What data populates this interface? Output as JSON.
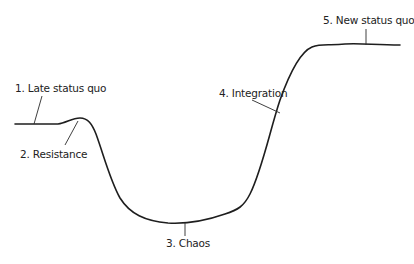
{
  "diagram": {
    "title": "",
    "type": "change curve",
    "stages": [
      {
        "id": 1,
        "label": "1. Late status quo"
      },
      {
        "id": 2,
        "label": "2. Resistance"
      },
      {
        "id": 3,
        "label": "3. Chaos"
      },
      {
        "id": 4,
        "label": "4. Integration"
      },
      {
        "id": 5,
        "label": "5. New status quo"
      }
    ],
    "colors": {
      "line": "#1e1e1e",
      "text": "#222222",
      "background": "#ffffff"
    }
  }
}
